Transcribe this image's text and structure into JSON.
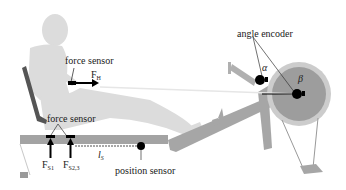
{
  "diagram": {
    "labels": {
      "force_sensor_handle": "force sensor",
      "handle_force": "F",
      "handle_force_sub": "H",
      "angle_encoder": "angle encoder",
      "alpha": "α",
      "beta": "β",
      "force_sensor_seat": "force sensor",
      "seat_force_1": "F",
      "seat_force_1_sub": "S1",
      "seat_force_23": "F",
      "seat_force_23_sub": "S2,3",
      "seat_position": "l",
      "seat_position_sub": "S",
      "position_sensor": "position sensor"
    },
    "colors": {
      "person": "#d9d9d9",
      "machine": "#a6a6a6",
      "flywheel_outer": "#c8c8c8",
      "flywheel_inner": "#9a9a9a",
      "backrest": "#555555",
      "marker": "#000000",
      "text": "#1a1a1a"
    }
  }
}
